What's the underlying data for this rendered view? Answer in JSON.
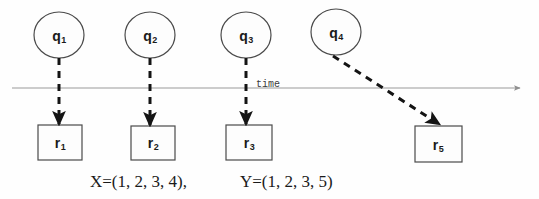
{
  "diagram": {
    "background_color": "#fefefe",
    "axis": {
      "label": "time",
      "label_x": 256,
      "label_y": 88,
      "line_color": "#999999",
      "y": 88,
      "x_start": 12,
      "x_end": 524
    },
    "query_nodes": [
      {
        "id": "q1",
        "letter": "q",
        "sub": "1",
        "cx": 59,
        "cy": 35,
        "rx": 25,
        "ry": 23
      },
      {
        "id": "q2",
        "letter": "q",
        "sub": "2",
        "cx": 150,
        "cy": 35,
        "rx": 25,
        "ry": 23
      },
      {
        "id": "q3",
        "letter": "q",
        "sub": "3",
        "cx": 246,
        "cy": 35,
        "rx": 25,
        "ry": 23
      },
      {
        "id": "q4",
        "letter": "q",
        "sub": "4",
        "cx": 336,
        "cy": 32,
        "rx": 25,
        "ry": 23
      }
    ],
    "result_nodes": [
      {
        "id": "r1",
        "letter": "r",
        "sub": "1",
        "x": 38,
        "y": 125,
        "w": 44,
        "h": 35
      },
      {
        "id": "r2",
        "letter": "r",
        "sub": "2",
        "x": 131,
        "y": 126,
        "w": 44,
        "h": 34
      },
      {
        "id": "r3",
        "letter": "r",
        "sub": "3",
        "x": 226,
        "y": 125,
        "w": 46,
        "h": 35
      },
      {
        "id": "r5",
        "letter": "r",
        "sub": "5",
        "x": 415,
        "y": 126,
        "w": 47,
        "h": 36
      }
    ],
    "edges": [
      {
        "from": "q1",
        "to": "r1",
        "x1": 59,
        "y1": 58,
        "x2": 59,
        "y2": 125,
        "style": "dashed"
      },
      {
        "from": "q2",
        "to": "r2",
        "x1": 150,
        "y1": 58,
        "x2": 150,
        "y2": 126,
        "style": "dashed"
      },
      {
        "from": "q3",
        "to": "r3",
        "x1": 246,
        "y1": 58,
        "x2": 246,
        "y2": 125,
        "style": "dashed"
      },
      {
        "from": "q4",
        "to": "r5",
        "x1": 333,
        "y1": 56,
        "x2": 440,
        "y2": 125,
        "style": "dashed"
      }
    ],
    "formulas": [
      {
        "id": "x-sequence",
        "text": "X=(1, 2, 3, 4),",
        "x": 90,
        "y": 182
      },
      {
        "id": "y-sequence",
        "text": "Y=(1, 2, 3, 5)",
        "x": 240,
        "y": 182
      }
    ],
    "colors": {
      "shape_stroke": "#4a4a4a",
      "shape_fill": "#fdfdfd",
      "edge_color": "#141414",
      "axis_color": "#9a9a9a",
      "text_color": "#1a1a1a"
    }
  }
}
